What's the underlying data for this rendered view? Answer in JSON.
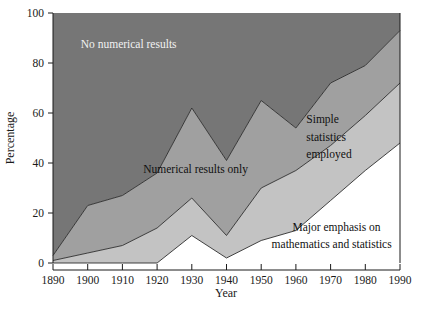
{
  "chart_data": {
    "type": "area",
    "stacked": true,
    "title": "",
    "xlabel": "Year",
    "ylabel": "Percentage",
    "x": [
      1890,
      1900,
      1910,
      1920,
      1930,
      1940,
      1950,
      1960,
      1970,
      1980,
      1990
    ],
    "xticklabels": [
      "1890",
      "1900",
      "1910",
      "1920",
      "1930",
      "1940",
      "1950",
      "1960",
      "1970",
      "1980",
      "1990"
    ],
    "yticklabels": [
      "0",
      "20",
      "40",
      "60",
      "80",
      "100"
    ],
    "yticks": [
      0,
      20,
      40,
      60,
      80,
      100
    ],
    "xlim": [
      1890,
      1990
    ],
    "ylim": [
      0,
      100
    ],
    "grid": false,
    "legend": "inline-annotations",
    "series": [
      {
        "name": "Major emphasis on mathematics and statistics",
        "label": "Major emphasis on mathematics and statistics",
        "color": "#ffffff",
        "values": [
          0,
          0,
          0,
          0,
          11,
          2,
          9,
          13,
          25,
          37,
          48
        ],
        "cumulative": [
          0,
          0,
          0,
          0,
          11,
          2,
          9,
          13,
          25,
          37,
          48
        ]
      },
      {
        "name": "Simple statistics employed",
        "label": "Simple statistics employed",
        "color": "#c3c3c3",
        "values": [
          1,
          4,
          7,
          14,
          15,
          9,
          21,
          24,
          22,
          22,
          24
        ],
        "cumulative": [
          1,
          4,
          7,
          14,
          26,
          11,
          30,
          37,
          47,
          59,
          72
        ]
      },
      {
        "name": "Numerical results only",
        "label": "Numerical results only",
        "color": "#a0a0a0",
        "values": [
          2,
          19,
          20,
          22,
          36,
          30,
          35,
          17,
          25,
          20,
          21
        ],
        "cumulative": [
          3,
          23,
          27,
          36,
          62,
          41,
          65,
          54,
          72,
          79,
          93
        ]
      },
      {
        "name": "No numerical results",
        "label": "No numerical results",
        "color": "#767676",
        "values": [
          97,
          77,
          73,
          64,
          38,
          59,
          35,
          46,
          28,
          21,
          7
        ],
        "cumulative": [
          100,
          100,
          100,
          100,
          100,
          100,
          100,
          100,
          100,
          100,
          100
        ]
      }
    ],
    "annotations": [
      {
        "text": "No numerical results",
        "x": 1898,
        "y": 86
      },
      {
        "text": "Numerical results only",
        "x": 1916,
        "y": 36
      },
      {
        "text": "Simple",
        "x": 1963,
        "y": 56
      },
      {
        "text": "statistics",
        "x": 1963,
        "y": 49
      },
      {
        "text": "employed",
        "x": 1963,
        "y": 42
      },
      {
        "text": "Major emphasis on",
        "x": 1959,
        "y": 13
      },
      {
        "text": "mathematics and statistics",
        "x": 1953,
        "y": 6
      }
    ]
  },
  "axes": {
    "y_title": "Percentage",
    "x_title": "Year"
  },
  "colors": {
    "band_no_numerical": "#767676",
    "band_numerical_only": "#a0a0a0",
    "band_simple_statistics": "#c3c3c3",
    "band_major_emphasis": "#ffffff",
    "outline": "#2b2b2b",
    "text": "#1a1a1a",
    "text_on_dark": "#f2f2f2"
  }
}
